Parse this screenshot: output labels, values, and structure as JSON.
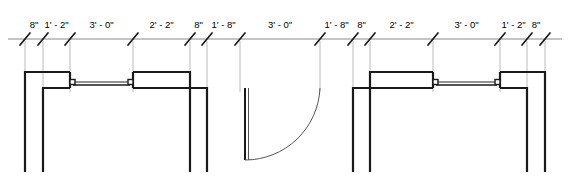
{
  "drawing": {
    "title": "Wall elevation dimension string with window and door openings",
    "type": "architectural-floor-plan",
    "colors": {
      "wall": "#1a1a1a",
      "dimension_line": "#8a8a8a",
      "extension_line": "#a8a8a8",
      "tick": "#1a1a1a",
      "glazing": "#6e6e6e",
      "door_swing": "#555555",
      "background": "#ffffff"
    },
    "dimension_string": {
      "line_y": 39,
      "tick_positions": [
        25,
        43,
        70,
        133,
        190,
        207,
        240,
        320,
        353,
        370,
        433,
        500,
        527,
        545
      ],
      "segments": [
        {
          "label": "8\"",
          "start": 25,
          "end": 43
        },
        {
          "label": "1' - 2\"",
          "start": 43,
          "end": 70
        },
        {
          "label": "3' - 0\"",
          "start": 70,
          "end": 133
        },
        {
          "label": "2' - 2\"",
          "start": 133,
          "end": 190
        },
        {
          "label": "8\"",
          "start": 190,
          "end": 207
        },
        {
          "label": "1' - 8\"",
          "start": 207,
          "end": 240
        },
        {
          "label": "3' - 0\"",
          "start": 240,
          "end": 320
        },
        {
          "label": "1' - 8\"",
          "start": 320,
          "end": 353
        },
        {
          "label": "8\"",
          "start": 353,
          "end": 370
        },
        {
          "label": "2' - 2\"",
          "start": 370,
          "end": 433
        },
        {
          "label": "3' - 0\"",
          "start": 433,
          "end": 500
        },
        {
          "label": "1' - 2\"",
          "start": 500,
          "end": 527
        },
        {
          "label": "8\"",
          "start": 527,
          "end": 545
        }
      ]
    },
    "geometry": {
      "wall_top_y": 72,
      "wall_inner_y": 88,
      "wall_bottom_y": 172,
      "left_assembly": {
        "outer_x": 25,
        "inner_x": 43,
        "window_start_x": 70,
        "window_end_x": 133,
        "return_outer_x": 190,
        "return_inner_x": 207
      },
      "right_assembly": {
        "outer_x": 545,
        "inner_x": 527,
        "window_start_x": 500,
        "window_end_x": 433,
        "return_outer_x": 370,
        "return_inner_x": 353
      },
      "door": {
        "jamb_left_x": 240,
        "jamb_right_x": 320,
        "panel_x": 245,
        "panel_top_y": 88,
        "panel_bottom_y": 160,
        "hinge_x": 320,
        "hinge_y": 88,
        "swing_radius": 75
      }
    }
  }
}
